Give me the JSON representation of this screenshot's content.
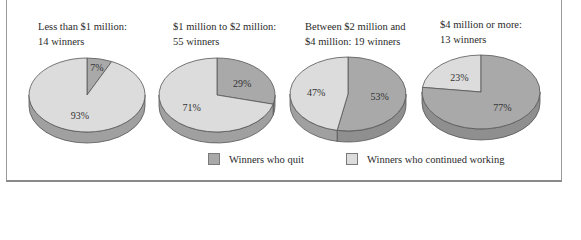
{
  "chart_data": {
    "type": "pie",
    "title": "",
    "colors": {
      "quit": "#a9a9a9",
      "continued": "#dcdcdc",
      "side_quit": "#8f8f8f",
      "side_continued": "#a0a0a0"
    },
    "legend": [
      {
        "key": "quit",
        "label": "Winners who quit"
      },
      {
        "key": "continued",
        "label": "Winners who continued working"
      }
    ],
    "charts": [
      {
        "title": "Less than $1 million:\n14 winners",
        "categories": [
          "Winners who quit",
          "Winners who continued working"
        ],
        "values": [
          7,
          93
        ],
        "labels": [
          "7%",
          "93%"
        ]
      },
      {
        "title": "$1 million to $2 million:\n55 winners",
        "categories": [
          "Winners who quit",
          "Winners who continued working"
        ],
        "values": [
          29,
          71
        ],
        "labels": [
          "29%",
          "71%"
        ]
      },
      {
        "title": "Between $2 million and\n$4 million: 19 winners",
        "categories": [
          "Winners who quit",
          "Winners who continued working"
        ],
        "values": [
          53,
          47
        ],
        "labels": [
          "53%",
          "47%"
        ]
      },
      {
        "title": "$4 million or more:\n13 winners",
        "categories": [
          "Winners who quit",
          "Winners who continued working"
        ],
        "values": [
          77,
          23
        ],
        "labels": [
          "77%",
          "23%"
        ]
      }
    ]
  }
}
